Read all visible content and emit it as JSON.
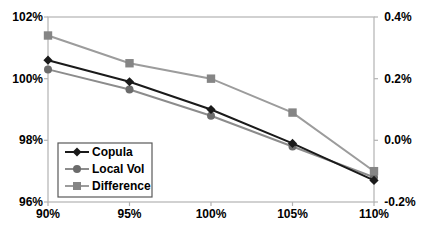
{
  "chart_data": {
    "type": "line",
    "title": "",
    "xlabel": "",
    "ylabel_left": "",
    "ylabel_right": "",
    "grid": false,
    "x_categories": [
      "90%",
      "95%",
      "100%",
      "105%",
      "110%"
    ],
    "x_values": [
      90,
      95,
      100,
      105,
      110
    ],
    "left_axis": {
      "min": 96,
      "max": 102,
      "ticks": [
        "102%",
        "100%",
        "98%",
        "96%"
      ],
      "tick_values": [
        102,
        100,
        98,
        96
      ]
    },
    "right_axis": {
      "min": -0.2,
      "max": 0.4,
      "ticks": [
        "0.4%",
        "0.2%",
        "0.0%",
        "-0.2%"
      ],
      "tick_values": [
        0.4,
        0.2,
        0.0,
        -0.2
      ]
    },
    "series": [
      {
        "name": "Copula",
        "axis": "left",
        "marker": "diamond",
        "color": "#1a1a1a",
        "marker_color": "#1a1a1a",
        "values": [
          100.6,
          99.9,
          99.0,
          97.9,
          96.7
        ]
      },
      {
        "name": "Local Vol",
        "axis": "left",
        "marker": "circle",
        "color": "#8c8c8c",
        "marker_color": "#6b6b6b",
        "values": [
          100.3,
          99.65,
          98.8,
          97.8,
          96.8
        ]
      },
      {
        "name": "Difference",
        "axis": "right",
        "marker": "square",
        "color": "#9c9c9c",
        "marker_color": "#858585",
        "values": [
          0.34,
          0.25,
          0.2,
          0.09,
          -0.1
        ]
      }
    ],
    "legend": {
      "position": "inside-bottom-left",
      "entries": [
        "Copula",
        "Local Vol",
        "Difference"
      ]
    },
    "axis_color": "#b3b3b3",
    "background": "#ffffff"
  }
}
